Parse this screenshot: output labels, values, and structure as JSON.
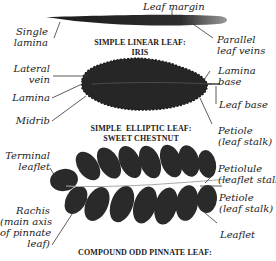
{
  "diagram": {
    "sections": [
      {
        "title": "SIMPLE LINEAR LEAF:\nIRIS",
        "labels": {
          "leaf_margin": "Leaf margin",
          "single_lamina": "Single\nlamina",
          "parallel_veins": "Parallel\nleaf veins"
        }
      },
      {
        "title": "SIMPLE  ELLIPTIC LEAF:\nSWEET CHESTNUT",
        "labels": {
          "lateral_vein": "Lateral\nvein",
          "lamina": "Lamina",
          "midrib": "Midrib",
          "lamina_base": "Lamina\nbase",
          "leaf_base": "Leaf base",
          "petiole": "Petiole\n(leaf stalk)"
        }
      },
      {
        "title": "COMPOUND ODD PINNATE LEAF:",
        "labels": {
          "terminal_leaflet": "Terminal\nleaflet",
          "rachis": "Rachis\n(main axis\nof pinnate\nleaf)",
          "petiolule": "Petiolule\n(leaflet stalk)",
          "petiole": "Petiole\n(leaf stalk)",
          "leaflet": "Leaflet"
        }
      }
    ],
    "colors": {
      "leaf": "#2a2a2a",
      "leader": "#333333",
      "background": "#ffffff"
    }
  }
}
